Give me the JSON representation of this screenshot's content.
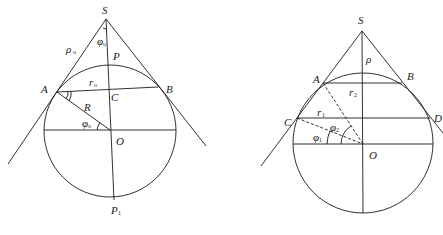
{
  "figures": [
    {
      "id": "left",
      "labels": {
        "S": "S",
        "rho0": "ρ",
        "rho0_sub": "o",
        "phi0_top": "φ",
        "phi0_top_sub": "o",
        "P": "P",
        "A": "A",
        "B": "B",
        "r0": "r",
        "r0_sub": "o",
        "C": "C",
        "R": "R",
        "phi0": "φ",
        "phi0_sub": "o",
        "O": "O",
        "P1": "P",
        "P1_sub": "1"
      }
    },
    {
      "id": "right",
      "labels": {
        "S": "S",
        "rho": "ρ",
        "A": "A",
        "B": "B",
        "r2": "r",
        "r2_sub": "2",
        "r1": "r",
        "r1_sub": "1",
        "C": "C",
        "D": "D",
        "phi2": "φ",
        "phi2_sub": "2",
        "phi1": "φ",
        "phi1_sub": "1",
        "O": "O"
      }
    }
  ],
  "colors": {
    "stroke": "#1a1a1a",
    "background": "#ffffff"
  }
}
